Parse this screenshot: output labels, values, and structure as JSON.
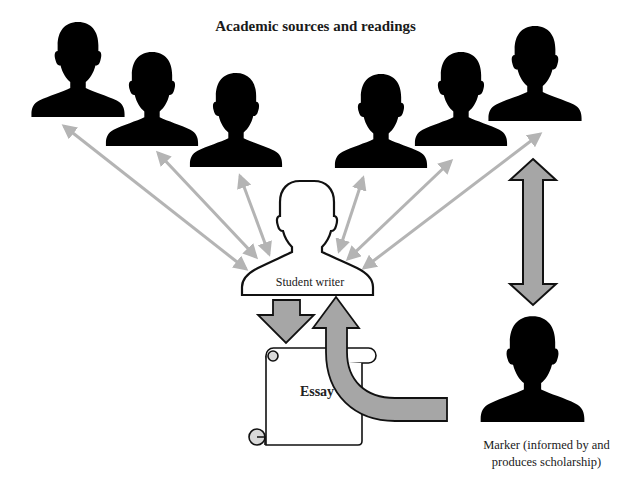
{
  "diagram": {
    "title": "Academic sources and readings",
    "nodes": {
      "sources": {
        "label": "Academic sources and readings",
        "count": 6
      },
      "student": {
        "label": "Student writer"
      },
      "essay": {
        "label": "Essay"
      },
      "marker": {
        "label_line1": "Marker (informed by and",
        "label_line2": "produces scholarship)"
      }
    },
    "edges": [
      {
        "from": "student",
        "to": "source-1",
        "type": "bidirectional-thin"
      },
      {
        "from": "student",
        "to": "source-2",
        "type": "bidirectional-thin"
      },
      {
        "from": "student",
        "to": "source-3",
        "type": "bidirectional-thin"
      },
      {
        "from": "student",
        "to": "source-4",
        "type": "bidirectional-thin"
      },
      {
        "from": "student",
        "to": "source-5",
        "type": "bidirectional-thin"
      },
      {
        "from": "student",
        "to": "source-6",
        "type": "bidirectional-thin"
      },
      {
        "from": "student",
        "to": "essay",
        "type": "block-arrow"
      },
      {
        "from": "marker",
        "to": "student",
        "type": "curved-block-arrow"
      },
      {
        "from": "marker",
        "to": "source-6",
        "type": "bidirectional-block"
      }
    ],
    "colors": {
      "silhouette": "#000000",
      "thin_arrow": "#b4b4b4",
      "block_arrow_fill": "#a6a6a6",
      "outline": "#111111"
    }
  }
}
